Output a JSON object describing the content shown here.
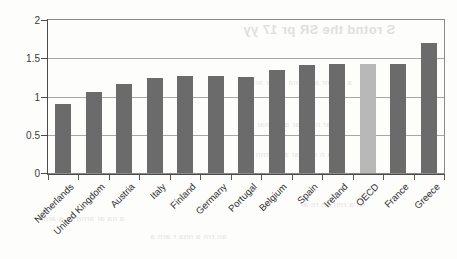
{
  "chart_data": {
    "type": "bar",
    "title": "",
    "xlabel": "",
    "ylabel": "",
    "ylim": [
      0,
      2
    ],
    "ytick_labels": [
      "0",
      "0.5",
      "1",
      "1.5",
      "2"
    ],
    "ytick_values": [
      0,
      0.5,
      1,
      1.5,
      2
    ],
    "grid": true,
    "legend": "none",
    "categories": [
      "Netherlands",
      "United Kingdom",
      "Austria",
      "Italy",
      "Finland",
      "Germany",
      "Portugal",
      "Belgium",
      "Spain",
      "Ireland",
      "OECD",
      "France",
      "Greece"
    ],
    "values": [
      0.9,
      1.06,
      1.16,
      1.24,
      1.27,
      1.27,
      1.26,
      1.35,
      1.41,
      1.42,
      1.42,
      1.43,
      1.7
    ],
    "highlight_category": "OECD",
    "bar_color": "#6b6b6b",
    "highlight_color": "#b8b8b8",
    "axis_color": "#4a4a4a",
    "grid_color": "#a6a6a6"
  },
  "bleed_through": {
    "title": "S rotnd the SR pr 17 yy",
    "line1": "a aarmr arr a na an ar arn",
    "line2": "a nar narn ar aan rnar an",
    "line3": "aa n r a aar ann rrnn a",
    "line4": "a na ar arnn rn a arnr",
    "line5": "an rrn a nna r arn a",
    "line6": "nr a rnn aa rn ar"
  }
}
